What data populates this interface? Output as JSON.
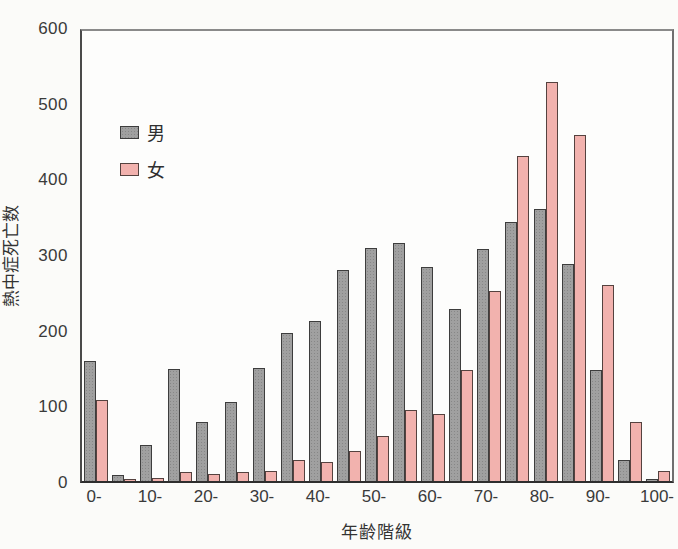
{
  "figure": {
    "background": "#fbfbf9"
  },
  "axes": {
    "x_title": "年齢階級",
    "y_title": "熱中症死亡数",
    "y_tick_labels": [
      "0",
      "100",
      "200",
      "300",
      "400",
      "500",
      "600"
    ],
    "x_tick_labels": [
      "0-",
      "10-",
      "20-",
      "30-",
      "40-",
      "50-",
      "60-",
      "70-",
      "80-",
      "90-",
      "100-"
    ]
  },
  "legend": {
    "entries": [
      {
        "label": "男",
        "color": "#a0a0a0"
      },
      {
        "label": "女",
        "color": "#f2b2ae"
      }
    ]
  },
  "chart_data": {
    "type": "bar",
    "title": "",
    "xlabel": "年齢階級",
    "ylabel": "熱中症死亡数",
    "ylim": [
      0,
      600
    ],
    "yticks": [
      0,
      100,
      200,
      300,
      400,
      500,
      600
    ],
    "grid": false,
    "legend_position": "upper-left-inside",
    "categories": [
      "0-",
      "5-",
      "10-",
      "15-",
      "20-",
      "25-",
      "30-",
      "35-",
      "40-",
      "45-",
      "50-",
      "55-",
      "60-",
      "65-",
      "70-",
      "75-",
      "80-",
      "85-",
      "90-",
      "95-",
      "100-"
    ],
    "xtick_shown_every": 2,
    "series": [
      {
        "name": "男",
        "fill": "#a0a0a0",
        "border": "#3d3d3d",
        "values": [
          160,
          8,
          48,
          149,
          79,
          105,
          151,
          197,
          214,
          281,
          311,
          318,
          285,
          229,
          310,
          346,
          363,
          289,
          148,
          28,
          3
        ]
      },
      {
        "name": "女",
        "fill": "#f2b2ae",
        "border": "#55423f",
        "values": [
          108,
          3,
          4,
          12,
          10,
          12,
          14,
          28,
          26,
          40,
          60,
          95,
          89,
          148,
          254,
          434,
          532,
          462,
          261,
          79,
          13
        ]
      }
    ]
  }
}
